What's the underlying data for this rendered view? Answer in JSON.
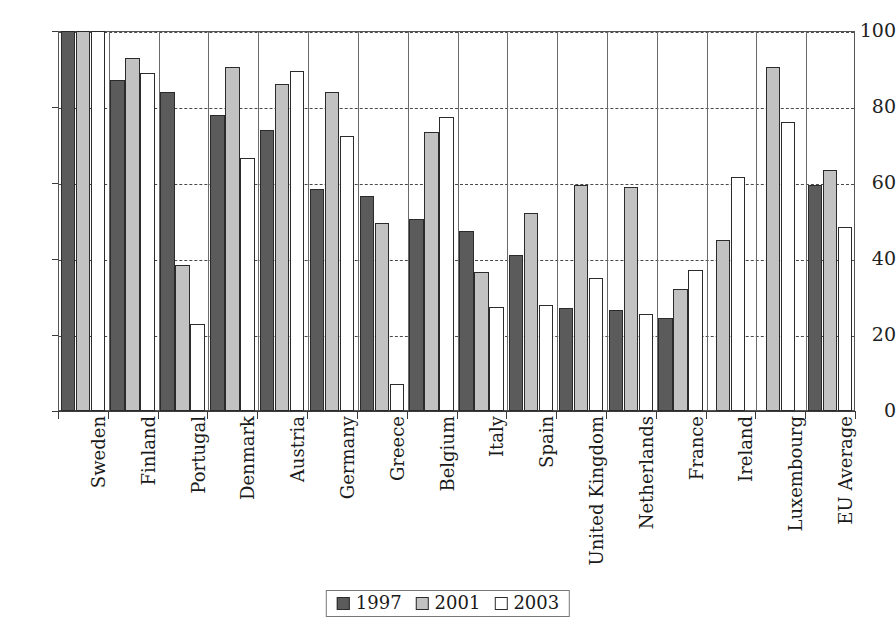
{
  "chart_data": {
    "type": "bar",
    "title": "",
    "subtitle": "",
    "xlabel": "",
    "ylabel": "",
    "ylim": [
      0,
      100
    ],
    "yticks": [
      0,
      20,
      40,
      60,
      80,
      100
    ],
    "grid": true,
    "legend_position": "bottom",
    "categories": [
      "Sweden",
      "Finland",
      "Portugal",
      "Denmark",
      "Austria",
      "Germany",
      "Greece",
      "Belgium",
      "Italy",
      "Spain",
      "United Kingdom",
      "Netherlands",
      "France",
      "Ireland",
      "Luxembourg",
      "EU Average"
    ],
    "series": [
      {
        "name": "1997",
        "color": "#5b5b5b",
        "values": [
          100,
          87,
          84,
          78,
          74,
          58.5,
          56.5,
          50.5,
          47.5,
          41,
          27,
          26.5,
          24.5,
          null,
          null,
          59.5
        ]
      },
      {
        "name": "2001",
        "color": "#c2c2c2",
        "values": [
          100,
          93,
          38.5,
          90.5,
          86,
          84,
          49.5,
          73.5,
          36.5,
          52,
          59.5,
          59,
          32,
          45,
          90.5,
          63.5
        ]
      },
      {
        "name": "2003",
        "color": "#ffffff",
        "values": [
          100,
          89,
          23,
          66.5,
          89.5,
          72.5,
          7,
          77.5,
          27.5,
          28,
          35,
          25.5,
          37,
          61.5,
          76,
          48.5
        ]
      }
    ]
  },
  "legend": {
    "entries": [
      {
        "label": "1997",
        "swatch": "s1997"
      },
      {
        "label": "2001",
        "swatch": "s2001"
      },
      {
        "label": "2003",
        "swatch": "s2003"
      }
    ]
  },
  "axes": {
    "y_tick_labels": [
      "100",
      "80",
      "60",
      "40",
      "20",
      "0"
    ]
  }
}
